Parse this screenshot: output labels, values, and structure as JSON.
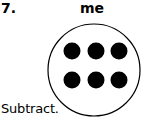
{
  "problem": {
    "number": "7.",
    "label": "me",
    "instruction": "Subtract."
  },
  "figure": {
    "shape": "circle",
    "circle": {
      "cx": 94,
      "cy": 70,
      "r": 46,
      "stroke": "#000000"
    },
    "dot_color": "#000000",
    "dot_rows": 2,
    "dot_cols": 3,
    "dot_count": 6
  }
}
